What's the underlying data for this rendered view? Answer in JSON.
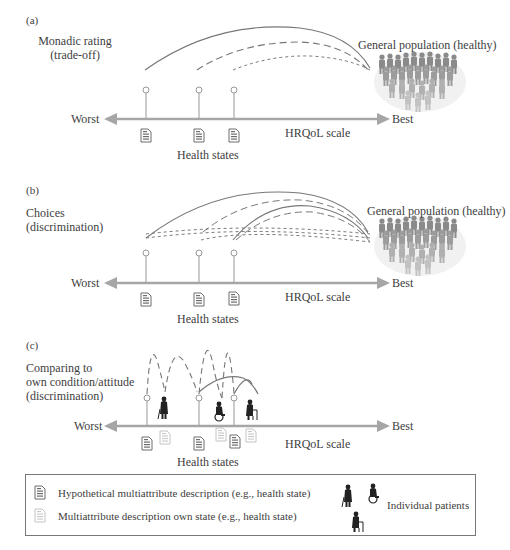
{
  "panels": [
    {
      "id": "a",
      "label": "(a)",
      "method_title_line1": "Monadic rating",
      "method_title_line2": "(trade-off)",
      "population_label": "General population (healthy)",
      "axis": {
        "left_label": "Worst",
        "right_label": "Best",
        "scale_label": "HRQoL scale"
      },
      "health_states_label": "Health states"
    },
    {
      "id": "b",
      "label": "(b)",
      "method_title_line1": "Choices",
      "method_title_line2": "(discrimination)",
      "population_label": "General population (healthy)",
      "axis": {
        "left_label": "Worst",
        "right_label": "Best",
        "scale_label": "HRQoL scale"
      },
      "health_states_label": "Health states"
    },
    {
      "id": "c",
      "label": "(c)",
      "method_title_line1": "Comparing to",
      "method_title_line2": "own condition/attitude",
      "method_title_line3": "(discrimination)",
      "axis": {
        "left_label": "Worst",
        "right_label": "Best",
        "scale_label": "HRQoL scale"
      },
      "health_states_label": "Health states"
    }
  ],
  "legend": {
    "items": [
      {
        "icon": "document-dark-icon",
        "label": "Hypothetical multiattribute description (e.g., health state)"
      },
      {
        "icon": "document-light-icon",
        "label": "Multiattribute description own state (e.g., health state)"
      }
    ],
    "patients_label": "Individual patients"
  },
  "colors": {
    "axis": "#a6a6a6",
    "curve": "#777777",
    "text": "#404040",
    "doc_dark": "#6d6d6d",
    "doc_light": "#c4c4c4",
    "patient": "#222222"
  }
}
